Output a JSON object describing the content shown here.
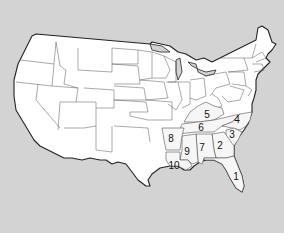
{
  "map": {
    "subject": "United States (contiguous)",
    "colors": {
      "water": "#d3d3d3",
      "land": "#ffffff",
      "border": "#222222",
      "margin": "#ffffff"
    },
    "labels": [
      {
        "id": "1",
        "text": "1",
        "region": "Florida",
        "x": 236,
        "y": 177
      },
      {
        "id": "2",
        "text": "2",
        "region": "Georgia",
        "x": 220,
        "y": 146
      },
      {
        "id": "3",
        "text": "3",
        "region": "South Carolina",
        "x": 232,
        "y": 135
      },
      {
        "id": "4",
        "text": "4",
        "region": "North Carolina",
        "x": 237,
        "y": 120
      },
      {
        "id": "5",
        "text": "5",
        "region": "Kentucky",
        "x": 207,
        "y": 115
      },
      {
        "id": "6",
        "text": "6",
        "region": "Tennessee",
        "x": 201,
        "y": 128
      },
      {
        "id": "7",
        "text": "7",
        "region": "Alabama",
        "x": 202,
        "y": 148
      },
      {
        "id": "8",
        "text": "8",
        "region": "Arkansas",
        "x": 171,
        "y": 139
      },
      {
        "id": "9",
        "text": "9",
        "region": "Mississippi",
        "x": 187,
        "y": 152
      },
      {
        "id": "10",
        "text": "10",
        "region": "Louisiana",
        "x": 174,
        "y": 166
      }
    ]
  }
}
